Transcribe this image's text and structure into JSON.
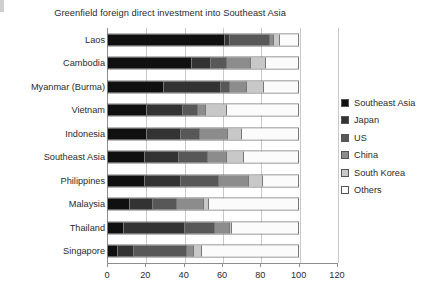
{
  "chart_data": {
    "type": "bar",
    "orientation": "horizontal",
    "stacked": true,
    "title": "Greenfield foreign direct investment into Southeast Asia",
    "xlabel": "",
    "ylabel": "",
    "xlim": [
      0,
      120
    ],
    "xticks": [
      0,
      20,
      40,
      60,
      80,
      100,
      120
    ],
    "xtick_labels": [
      "0",
      "20",
      "40",
      "60",
      "80",
      "100",
      "120"
    ],
    "grid": true,
    "grid_axis": "x",
    "legend_position": "right",
    "categories": [
      "Laos",
      "Cambodia",
      "Myanmar (Burma)",
      "Vietnam",
      "Indonesia",
      "Southeast Asia",
      "Philippines",
      "Malaysia",
      "Thailand",
      "Singapore"
    ],
    "series": [
      {
        "name": "Southeast Asia",
        "color": "#101010",
        "values": [
          61,
          44,
          29,
          20,
          20,
          19,
          19,
          11,
          8,
          5
        ]
      },
      {
        "name": "Japan",
        "color": "#333333",
        "values": [
          3,
          10,
          30,
          19,
          18,
          18,
          19,
          12,
          32,
          8
        ]
      },
      {
        "name": "US",
        "color": "#585858",
        "values": [
          21,
          8,
          5,
          8,
          10,
          15,
          20,
          13,
          16,
          28
        ]
      },
      {
        "name": "China",
        "color": "#8c8c8c",
        "values": [
          2,
          13,
          9,
          4,
          15,
          10,
          16,
          14,
          8,
          4
        ]
      },
      {
        "name": "South Korea",
        "color": "#c8c8c8",
        "values": [
          3,
          8,
          9,
          11,
          7,
          9,
          7,
          3,
          1,
          4
        ]
      },
      {
        "name": "Others",
        "color": "#fbfbfb",
        "values": [
          10,
          17,
          18,
          38,
          30,
          29,
          19,
          47,
          35,
          51
        ]
      }
    ]
  },
  "legend": {
    "items": [
      {
        "label": "Southeast Asia",
        "color": "#101010"
      },
      {
        "label": "Japan",
        "color": "#333333"
      },
      {
        "label": "US",
        "color": "#585858"
      },
      {
        "label": "China",
        "color": "#8c8c8c"
      },
      {
        "label": "South Korea",
        "color": "#c8c8c8"
      },
      {
        "label": "Others",
        "color": "#fbfbfb"
      }
    ]
  }
}
